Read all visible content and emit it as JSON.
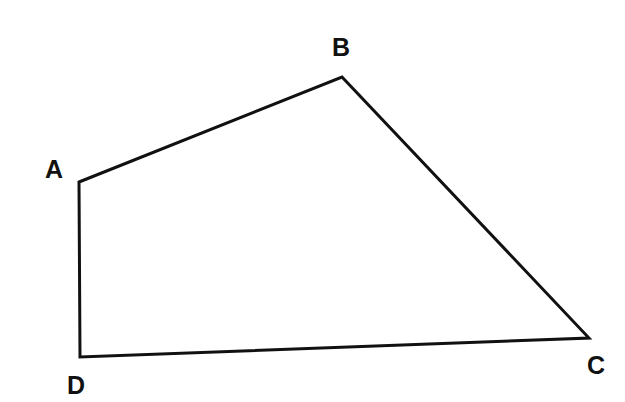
{
  "diagram": {
    "type": "quadrilateral",
    "stroke_color": "#111111",
    "vertices": [
      {
        "name": "A",
        "label": "A",
        "x": 79,
        "y": 182,
        "label_x": 54,
        "label_y": 178
      },
      {
        "name": "B",
        "label": "B",
        "x": 342,
        "y": 77,
        "label_x": 341,
        "label_y": 56
      },
      {
        "name": "C",
        "label": "C",
        "x": 589,
        "y": 338,
        "label_x": 596,
        "label_y": 374
      },
      {
        "name": "D",
        "label": "D",
        "x": 80,
        "y": 357,
        "label_x": 76,
        "label_y": 394
      }
    ]
  }
}
